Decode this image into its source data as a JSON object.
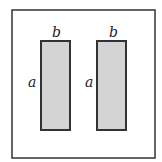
{
  "diagram": {
    "outer_square": {
      "stroke": "#333333",
      "fill": "#ffffff"
    },
    "rectangles": [
      {
        "top_label": "b",
        "side_label": "a",
        "fill": "#d4d4d4",
        "stroke": "#333333"
      },
      {
        "top_label": "b",
        "side_label": "a",
        "fill": "#d4d4d4",
        "stroke": "#333333"
      }
    ]
  }
}
